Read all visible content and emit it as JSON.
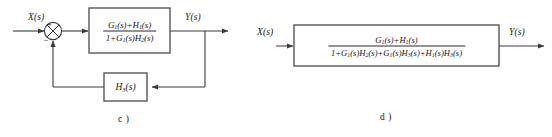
{
  "figure": {
    "type": "control-system-block-diagram",
    "panels": [
      {
        "id": "c",
        "caption": "c )",
        "input_label": "X(s)",
        "output_label": "Y(s)",
        "summing_junction": {
          "name": "summing-junction",
          "style": "circle-with-x",
          "plus_sign": "+",
          "minus_sign": "–"
        },
        "forward_block": {
          "name": "forward-transfer-block",
          "numerator": "G₁(s)+H₁(s)",
          "denominator": "1+G₁(s)H₂(s)",
          "numerator_parts": {
            "base1": "G",
            "sub1": "1",
            "mid": "(s)+",
            "base2": "H",
            "sub2": "1",
            "tail": "(s)"
          },
          "denominator_parts": {
            "lead": "1+",
            "base1": "G",
            "sub1": "1",
            "mid": "(s)",
            "base2": "H",
            "sub2": "2",
            "tail": "(s)"
          }
        },
        "feedback_block": {
          "name": "feedback-transfer-block",
          "label": "H₃(s)",
          "base": "H",
          "sub": "3",
          "tail": "(s)"
        }
      },
      {
        "id": "d",
        "caption": "d )",
        "input_label": "X(s)",
        "output_label": "Y(s)",
        "equivalent_block": {
          "name": "equivalent-transfer-block",
          "numerator": "G₁(s)+H₁(s)",
          "denominator": "1+G₁(s)H₂(s)+G₁(s)H₃(s)+H₁(s)H₃(s)"
        }
      }
    ]
  },
  "colors": {
    "line": "#3a3a3a",
    "box_border": "#4a4a4a",
    "text": "#141414",
    "background": "#fefefe"
  }
}
